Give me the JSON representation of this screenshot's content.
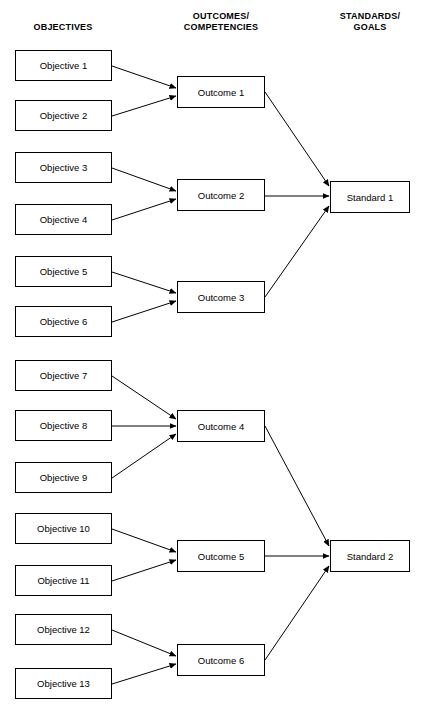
{
  "headers": {
    "objectives": "OBJECTIVES",
    "outcomes": "OUTCOMES/\nCOMPETENCIES",
    "standards": "STANDARDS/\nGOALS"
  },
  "objectives": [
    {
      "label": "Objective 1",
      "top": 50
    },
    {
      "label": "Objective 2",
      "top": 100
    },
    {
      "label": "Objective 3",
      "top": 152
    },
    {
      "label": "Objective 4",
      "top": 204
    },
    {
      "label": "Objective 5",
      "top": 256
    },
    {
      "label": "Objective 6",
      "top": 306
    },
    {
      "label": "Objective 7",
      "top": 360
    },
    {
      "label": "Objective 8",
      "top": 410
    },
    {
      "label": "Objective 9",
      "top": 462
    },
    {
      "label": "Objective 10",
      "top": 513
    },
    {
      "label": "Objective 11",
      "top": 565
    },
    {
      "label": "Objective 12",
      "top": 614
    },
    {
      "label": "Objective 13",
      "top": 668
    }
  ],
  "outcomes": [
    {
      "label": "Outcome 1",
      "top": 76
    },
    {
      "label": "Outcome 2",
      "top": 179
    },
    {
      "label": "Outcome 3",
      "top": 281
    },
    {
      "label": "Outcome 4",
      "top": 410
    },
    {
      "label": "Outcome 5",
      "top": 540
    },
    {
      "label": "Outcome 6",
      "top": 644
    }
  ],
  "standards": [
    {
      "label": "Standard 1",
      "top": 181
    },
    {
      "label": "Standard 2",
      "top": 540
    }
  ],
  "edges": [
    {
      "from": "Objective 1",
      "to": "Outcome 1",
      "x1": 112,
      "y1": 66,
      "x2": 176,
      "y2": 88
    },
    {
      "from": "Objective 2",
      "to": "Outcome 1",
      "x1": 112,
      "y1": 116,
      "x2": 176,
      "y2": 96
    },
    {
      "from": "Objective 3",
      "to": "Outcome 2",
      "x1": 112,
      "y1": 168,
      "x2": 176,
      "y2": 191
    },
    {
      "from": "Objective 4",
      "to": "Outcome 2",
      "x1": 112,
      "y1": 220,
      "x2": 176,
      "y2": 199
    },
    {
      "from": "Objective 5",
      "to": "Outcome 3",
      "x1": 112,
      "y1": 272,
      "x2": 176,
      "y2": 293
    },
    {
      "from": "Objective 6",
      "to": "Outcome 3",
      "x1": 112,
      "y1": 322,
      "x2": 176,
      "y2": 301
    },
    {
      "from": "Objective 7",
      "to": "Outcome 4",
      "x1": 112,
      "y1": 376,
      "x2": 176,
      "y2": 419
    },
    {
      "from": "Objective 8",
      "to": "Outcome 4",
      "x1": 112,
      "y1": 426,
      "x2": 176,
      "y2": 426
    },
    {
      "from": "Objective 9",
      "to": "Outcome 4",
      "x1": 112,
      "y1": 478,
      "x2": 176,
      "y2": 434
    },
    {
      "from": "Objective 10",
      "to": "Outcome 5",
      "x1": 112,
      "y1": 529,
      "x2": 176,
      "y2": 552
    },
    {
      "from": "Objective 11",
      "to": "Outcome 5",
      "x1": 112,
      "y1": 581,
      "x2": 176,
      "y2": 560
    },
    {
      "from": "Objective 12",
      "to": "Outcome 6",
      "x1": 112,
      "y1": 630,
      "x2": 176,
      "y2": 656
    },
    {
      "from": "Objective 13",
      "to": "Outcome 6",
      "x1": 112,
      "y1": 684,
      "x2": 176,
      "y2": 664
    },
    {
      "from": "Outcome 1",
      "to": "Standard 1",
      "x1": 265,
      "y1": 92,
      "x2": 329,
      "y2": 186
    },
    {
      "from": "Outcome 2",
      "to": "Standard 1",
      "x1": 265,
      "y1": 196,
      "x2": 329,
      "y2": 196
    },
    {
      "from": "Outcome 3",
      "to": "Standard 1",
      "x1": 265,
      "y1": 297,
      "x2": 329,
      "y2": 206
    },
    {
      "from": "Outcome 4",
      "to": "Standard 2",
      "x1": 265,
      "y1": 426,
      "x2": 329,
      "y2": 546
    },
    {
      "from": "Outcome 5",
      "to": "Standard 2",
      "x1": 265,
      "y1": 556,
      "x2": 329,
      "y2": 556
    },
    {
      "from": "Outcome 6",
      "to": "Standard 2",
      "x1": 265,
      "y1": 660,
      "x2": 329,
      "y2": 566
    }
  ]
}
